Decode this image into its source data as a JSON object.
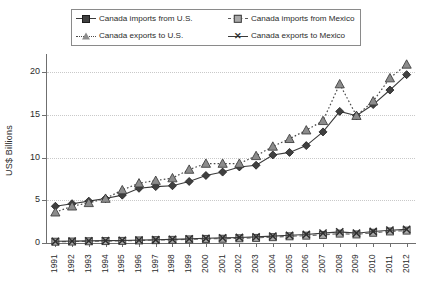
{
  "chart_data": {
    "type": "line",
    "title": "",
    "xlabel": "",
    "ylabel": "US$ Billions",
    "ylim": [
      0,
      22
    ],
    "yticks": [
      0,
      5,
      10,
      15,
      20
    ],
    "grid": true,
    "legend_position": "top",
    "categories": [
      "1991",
      "1992",
      "1993",
      "1994",
      "1995",
      "1996",
      "1997",
      "1998",
      "1999",
      "2000",
      "2001",
      "2002",
      "2003",
      "2004",
      "2005",
      "2006",
      "2007",
      "2008",
      "2009",
      "2010",
      "2011",
      "2012"
    ],
    "series": [
      {
        "name": "Canada imports from U.S.",
        "marker": "diamond",
        "line_style": "solid",
        "color": "#404040",
        "values": [
          4.3,
          4.6,
          4.9,
          5.2,
          5.6,
          6.4,
          6.6,
          6.7,
          7.2,
          7.9,
          8.3,
          8.9,
          9.1,
          10.3,
          10.6,
          11.4,
          13.0,
          15.4,
          14.9,
          16.2,
          17.9,
          19.7
        ]
      },
      {
        "name": "Canada exports to U.S.",
        "marker": "triangle",
        "line_style": "dotted",
        "color": "#8c8c8c",
        "values": [
          3.6,
          4.3,
          4.7,
          5.2,
          6.2,
          7.0,
          7.3,
          7.6,
          8.6,
          9.3,
          9.3,
          9.3,
          10.2,
          11.3,
          12.2,
          13.2,
          14.3,
          18.6,
          14.9,
          16.6,
          19.3,
          20.9
        ]
      },
      {
        "name": "Canada imports from Mexico",
        "marker": "square",
        "line_style": "dashed",
        "color": "#a9a9a9",
        "values": [
          0.15,
          0.17,
          0.2,
          0.22,
          0.25,
          0.3,
          0.33,
          0.37,
          0.42,
          0.48,
          0.5,
          0.55,
          0.6,
          0.68,
          0.78,
          0.86,
          0.95,
          1.1,
          1.0,
          1.2,
          1.35,
          1.45
        ]
      },
      {
        "name": "Canada exports to Mexico",
        "marker": "x-cross",
        "line_style": "solid",
        "color": "#2f2f2f",
        "values": [
          0.2,
          0.22,
          0.25,
          0.28,
          0.3,
          0.34,
          0.38,
          0.42,
          0.48,
          0.55,
          0.6,
          0.65,
          0.72,
          0.8,
          0.9,
          1.0,
          1.15,
          1.3,
          1.15,
          1.35,
          1.5,
          1.6
        ]
      }
    ]
  },
  "legend": {
    "entries": [
      {
        "label": "Canada imports from U.S."
      },
      {
        "label": "Canada imports from Mexico"
      },
      {
        "label": "Canada exports to U.S."
      },
      {
        "label": "Canada exports to Mexico"
      }
    ]
  },
  "axis": {
    "y_label": "US$ Billions",
    "y_tick_labels": [
      "0",
      "5",
      "10",
      "15",
      "20"
    ],
    "x_tick_labels": [
      "1991",
      "1992",
      "1993",
      "1994",
      "1995",
      "1996",
      "1997",
      "1998",
      "1999",
      "2000",
      "2001",
      "2002",
      "2003",
      "2004",
      "2005",
      "2006",
      "2007",
      "2008",
      "2009",
      "2010",
      "2011",
      "2012"
    ]
  },
  "colors": {
    "imports_us": "#404040",
    "exports_us": "#8c8c8c",
    "imports_mx": "#a9a9a9",
    "exports_mx": "#2f2f2f",
    "grid": "#c9c9c9",
    "axis": "#6f6f6f"
  }
}
